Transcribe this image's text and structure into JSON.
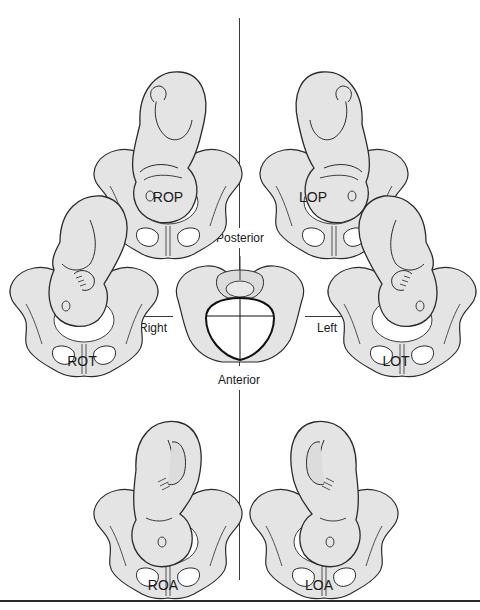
{
  "diagram": {
    "type": "fetal-position-diagram",
    "center": {
      "name": "pelvic-inlet",
      "directions": {
        "top": "Posterior",
        "bottom": "Anterior",
        "left": "Right",
        "right": "Left"
      }
    },
    "positions": [
      {
        "id": "rop",
        "label": "ROP",
        "row": "top",
        "side": "left"
      },
      {
        "id": "lop",
        "label": "LOP",
        "row": "top",
        "side": "right"
      },
      {
        "id": "rot",
        "label": "ROT",
        "row": "middle",
        "side": "left"
      },
      {
        "id": "lot",
        "label": "LOT",
        "row": "middle",
        "side": "right"
      },
      {
        "id": "roa",
        "label": "ROA",
        "row": "bottom",
        "side": "left"
      },
      {
        "id": "loa",
        "label": "LOA",
        "row": "bottom",
        "side": "right"
      }
    ],
    "colors": {
      "fill": "#e4e4e4",
      "shade": "#cfcfcf",
      "stroke": "#2b2b2b",
      "background": "#ffffff",
      "axis": "#3a3a3a"
    }
  }
}
